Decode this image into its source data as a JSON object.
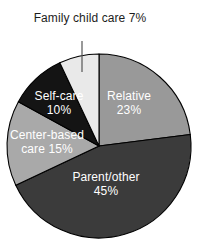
{
  "chart_data": {
    "type": "pie",
    "title": "",
    "subtitle": "",
    "xlabel": "",
    "ylabel": "",
    "legend_position": "none",
    "grid": false,
    "units": "percent",
    "total": 100,
    "start_angle_deg": 0,
    "direction": "clockwise",
    "categories": [
      "Relative",
      "Parent/other",
      "Center-based care",
      "Self-care",
      "Family child care"
    ],
    "values": [
      23,
      45,
      15,
      10,
      7
    ],
    "slices": [
      {
        "name": "Relative",
        "value": 23,
        "value_text": "23%",
        "label_line1": "Relative",
        "label_line2": "23%",
        "color": "#999999",
        "label_color": "#ffffff",
        "label_placement": "inside"
      },
      {
        "name": "Parent/other",
        "value": 45,
        "value_text": "45%",
        "label_line1": "Parent/other",
        "label_line2": "45%",
        "color": "#3b3b3b",
        "label_color": "#ffffff",
        "label_placement": "inside"
      },
      {
        "name": "Center-based care",
        "value": 15,
        "value_text": "15%",
        "label_line1": "Center-based",
        "label_line2": "care 15%",
        "color": "#a9a9a9",
        "label_color": "#ffffff",
        "label_placement": "inside"
      },
      {
        "name": "Self-care",
        "value": 10,
        "value_text": "10%",
        "label_line1": "Self-care",
        "label_line2": "10%",
        "color": "#141414",
        "label_color": "#ffffff",
        "label_placement": "inside"
      },
      {
        "name": "Family child care",
        "value": 7,
        "value_text": "7%",
        "label_line1": "Family child",
        "label_line2": "care 7%",
        "color": "#e9e9e9",
        "label_color": "#1d1d1d",
        "label_placement": "callout-above"
      }
    ],
    "annotations": [
      {
        "name": "family-child-care-leader-line",
        "text": "",
        "target_slice": "Family child care"
      }
    ]
  },
  "colors": {
    "background": "#ffffff",
    "outline": "#000000",
    "leader_line": "#555555",
    "callout_text": "#1d1d1d",
    "inside_text": "#ffffff"
  }
}
